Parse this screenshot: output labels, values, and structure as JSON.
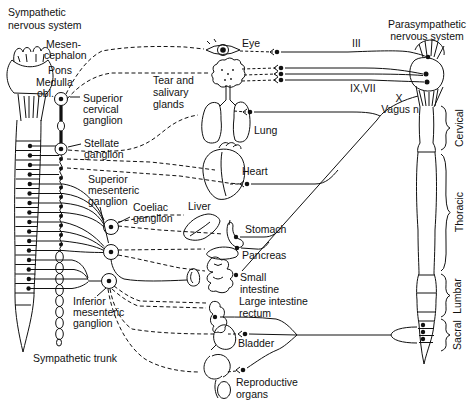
{
  "titles": {
    "left": [
      "Sympathetic",
      "nervous system"
    ],
    "right": [
      "Parasympathetic",
      "nervous system"
    ]
  },
  "brainstem": {
    "mesencephalon": [
      "Mesen-",
      "cephalon"
    ],
    "pons": "Pons",
    "medulla": [
      "Medulla",
      "obl."
    ]
  },
  "ganglia": {
    "superior_cervical": [
      "Superior",
      "cervical",
      "ganglion"
    ],
    "stellate": [
      "Stellate",
      "ganglion"
    ],
    "superior_mesenteric": [
      "Superior",
      "mesenteric",
      "ganglion"
    ],
    "coeliac": [
      "Coeliac",
      "ganglion"
    ],
    "inferior_mesenteric": [
      "Inferior",
      "mesenteric",
      "ganglion"
    ],
    "trunk": "Sympathetic trunk"
  },
  "organs": {
    "eye": "Eye",
    "glands": [
      "Tear and",
      "salivary",
      "glands"
    ],
    "lung": "Lung",
    "heart": "Heart",
    "liver": "Liver",
    "stomach": "Stomach",
    "pancreas": "Pancreas",
    "small_intestine": [
      "Small",
      "intestine"
    ],
    "large_intestine": [
      "Large intestine",
      "rectum"
    ],
    "bladder": "Bladder",
    "reproductive": [
      "Reproductive",
      "organs"
    ]
  },
  "cranial_nerves": {
    "iii": "III",
    "ix_vii": "IX,VII",
    "x": "X",
    "vagus": "Vagus n"
  },
  "spinal_regions": {
    "cervical": "Cervical",
    "thoracic": "Thoracic",
    "lumbar": "Lumbar",
    "sacral": "Sacral"
  },
  "colors": {
    "ink": "#111111",
    "background": "#ffffff"
  }
}
